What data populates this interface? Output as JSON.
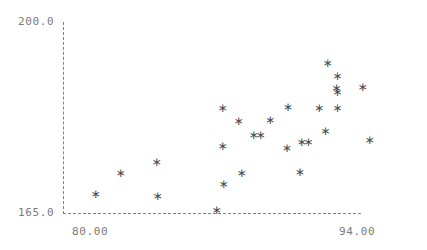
{
  "chart_data": {
    "type": "scatter",
    "title": "",
    "subtitle": "",
    "xlabel": "",
    "ylabel": "",
    "xlim": [
      80.0,
      94.0
    ],
    "ylim": [
      165.0,
      200.0
    ],
    "grid": false,
    "legend": null,
    "marker": "asterisk",
    "marker_color": "#4a4a4a",
    "axis_color": "#808080",
    "axis_style": "dashed",
    "x_ticks": [
      80.0,
      94.0
    ],
    "x_tick_labels": [
      "80.00",
      "94.00"
    ],
    "y_ticks": [
      165.0,
      200.0
    ],
    "y_tick_labels": [
      "165.0",
      "200.0"
    ],
    "points": [
      {
        "x": 80.0,
        "y": 168.3
      },
      {
        "x": 81.31,
        "y": 172.3
      },
      {
        "x": 83.2,
        "y": 174.3
      },
      {
        "x": 83.25,
        "y": 168.1
      },
      {
        "x": 86.35,
        "y": 165.5
      },
      {
        "x": 86.66,
        "y": 177.2
      },
      {
        "x": 86.71,
        "y": 170.2
      },
      {
        "x": 86.66,
        "y": 184.2
      },
      {
        "x": 87.5,
        "y": 181.8
      },
      {
        "x": 87.66,
        "y": 172.2
      },
      {
        "x": 88.28,
        "y": 179.2
      },
      {
        "x": 88.65,
        "y": 179.2
      },
      {
        "x": 89.15,
        "y": 181.9
      },
      {
        "x": 90.03,
        "y": 176.8
      },
      {
        "x": 90.08,
        "y": 184.3
      },
      {
        "x": 90.71,
        "y": 172.5
      },
      {
        "x": 90.8,
        "y": 178.0
      },
      {
        "x": 91.16,
        "y": 178.0
      },
      {
        "x": 91.72,
        "y": 184.2
      },
      {
        "x": 92.05,
        "y": 180.0
      },
      {
        "x": 92.16,
        "y": 192.4
      },
      {
        "x": 92.63,
        "y": 187.8
      },
      {
        "x": 92.68,
        "y": 190.0
      },
      {
        "x": 92.68,
        "y": 187.0
      },
      {
        "x": 92.68,
        "y": 184.1
      },
      {
        "x": 94.0,
        "y": 188.0
      },
      {
        "x": 94.37,
        "y": 178.2
      }
    ]
  }
}
